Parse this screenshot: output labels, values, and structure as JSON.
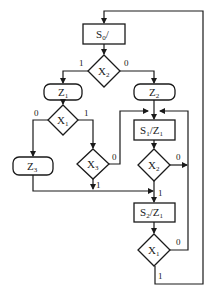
{
  "diagram": {
    "type": "ASM chart / algorithmic state machine flowchart",
    "nodes": {
      "s0": {
        "kind": "state",
        "main": "S",
        "sub": "0",
        "suffix": "/"
      },
      "x2_top": {
        "kind": "decision",
        "main": "X",
        "sub": "2"
      },
      "z1": {
        "kind": "conditional-output",
        "main": "Z",
        "sub": "1"
      },
      "z2": {
        "kind": "conditional-output",
        "main": "Z",
        "sub": "2"
      },
      "x1_left": {
        "kind": "decision",
        "main": "X",
        "sub": "1"
      },
      "z3": {
        "kind": "conditional-output",
        "main": "Z",
        "sub": "3"
      },
      "x3": {
        "kind": "decision",
        "main": "X",
        "sub": "3"
      },
      "s1": {
        "kind": "state",
        "main": "S",
        "sub": "1",
        "suffix": "/Z",
        "suffix_sub": "1"
      },
      "x2_low": {
        "kind": "decision",
        "main": "X",
        "sub": "2"
      },
      "s2": {
        "kind": "state",
        "main": "S",
        "sub": "2",
        "suffix": "/Z",
        "suffix_sub": "1"
      },
      "x1_low": {
        "kind": "decision",
        "main": "X",
        "sub": "1"
      }
    },
    "edge_labels": {
      "x2_top_1": "1",
      "x2_top_0": "0",
      "x1_left_0": "0",
      "x1_left_1": "1",
      "x3_0": "0",
      "x3_1": "1",
      "x2_low_0": "0",
      "x2_low_1": "1",
      "x1_low_0": "0",
      "x1_low_1": "1"
    },
    "edges": [
      {
        "from": "s0",
        "to": "x2_top"
      },
      {
        "from": "x2_top",
        "to": "z1",
        "label": "1"
      },
      {
        "from": "x2_top",
        "to": "z2",
        "label": "0"
      },
      {
        "from": "z1",
        "to": "x1_left"
      },
      {
        "from": "x1_left",
        "to": "z3",
        "label": "0"
      },
      {
        "from": "x1_left",
        "to": "x3",
        "label": "1"
      },
      {
        "from": "x3",
        "to": "s1",
        "label": "0"
      },
      {
        "from": "x3",
        "to": "s2",
        "label": "1"
      },
      {
        "from": "z3",
        "to": "s2"
      },
      {
        "from": "z2",
        "to": "s1"
      },
      {
        "from": "s1",
        "to": "x2_low"
      },
      {
        "from": "x2_low",
        "to": "s1",
        "label": "0"
      },
      {
        "from": "x2_low",
        "to": "s2",
        "label": "1"
      },
      {
        "from": "s2",
        "to": "x1_low"
      },
      {
        "from": "x1_low",
        "to": "s1",
        "label": "0"
      },
      {
        "from": "x1_low",
        "to": "s0",
        "label": "1"
      }
    ]
  }
}
